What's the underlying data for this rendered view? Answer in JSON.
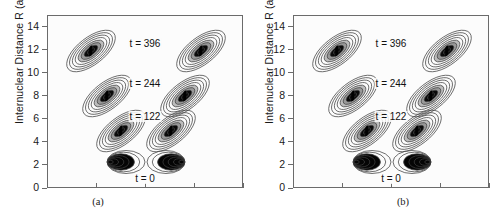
{
  "figure": {
    "panels": [
      {
        "id": "a",
        "caption": "(a)",
        "yaxis": {
          "title": "Internuclear Distance R (a.u.)",
          "ticks": [
            "14",
            "12",
            "10",
            "8",
            "6",
            "4",
            "2",
            "0"
          ],
          "min": 0,
          "max": 15
        },
        "xaxis": {
          "title": "",
          "ticks": [
            "",
            "",
            "",
            "",
            ""
          ]
        },
        "time_labels": [
          "t = 396",
          "t = 244",
          "t = 122",
          "t = 0"
        ]
      },
      {
        "id": "b",
        "caption": "(b)",
        "yaxis": {
          "title": "Internuclear Distance R (a.u.)",
          "ticks": [
            "14",
            "12",
            "10",
            "8",
            "6",
            "4",
            "2",
            "0"
          ],
          "min": 0,
          "max": 15
        },
        "xaxis": {
          "title": "",
          "ticks": [
            "",
            "",
            "",
            "",
            ""
          ]
        },
        "time_labels": [
          "t = 396",
          "t = 244",
          "t = 122",
          "t = 0"
        ]
      }
    ]
  },
  "chart_data": {
    "type": "contour",
    "title": "",
    "xlabel": "",
    "ylabel": "Internuclear Distance R (a.u.)",
    "ylim": [
      0,
      15
    ],
    "ytick_values": [
      0,
      2,
      4,
      6,
      8,
      10,
      12,
      14
    ],
    "xtick_count": 5,
    "grid": false,
    "legend": "none",
    "panels": [
      {
        "label": "(a)",
        "annotations": [
          {
            "text": "t = 396",
            "R": 12.6
          },
          {
            "text": "t = 244",
            "R": 9.1
          },
          {
            "text": "t = 122",
            "R": 6.2
          },
          {
            "text": "t = 0",
            "R": 0.9
          }
        ],
        "lobes": [
          {
            "time": 0,
            "R": 2.3,
            "side": "left",
            "x_rel": 0.4,
            "tilt_deg": 0,
            "rings": 7,
            "filled": true
          },
          {
            "time": 0,
            "R": 2.3,
            "side": "right",
            "x_rel": 0.6,
            "tilt_deg": 0,
            "rings": 7,
            "filled": true
          },
          {
            "time": 122,
            "R": 5.0,
            "side": "left",
            "x_rel": 0.37,
            "tilt_deg": -38,
            "rings": 8,
            "filled": false
          },
          {
            "time": 122,
            "R": 5.0,
            "side": "right",
            "x_rel": 0.63,
            "tilt_deg": -38,
            "rings": 8,
            "filled": false
          },
          {
            "time": 244,
            "R": 8.1,
            "side": "left",
            "x_rel": 0.3,
            "tilt_deg": -38,
            "rings": 8,
            "filled": false
          },
          {
            "time": 244,
            "R": 8.1,
            "side": "right",
            "x_rel": 0.7,
            "tilt_deg": -38,
            "rings": 8,
            "filled": false
          },
          {
            "time": 396,
            "R": 12.0,
            "side": "left",
            "x_rel": 0.22,
            "tilt_deg": -38,
            "rings": 8,
            "filled": false
          },
          {
            "time": 396,
            "R": 12.0,
            "side": "right",
            "x_rel": 0.78,
            "tilt_deg": -38,
            "rings": 8,
            "filled": false
          }
        ]
      },
      {
        "label": "(b)",
        "annotations": [
          {
            "text": "t = 396",
            "R": 12.6
          },
          {
            "text": "t = 244",
            "R": 9.1
          },
          {
            "text": "t = 122",
            "R": 6.2
          },
          {
            "text": "t = 0",
            "R": 0.9
          }
        ],
        "lobes": [
          {
            "time": 0,
            "R": 2.3,
            "side": "left",
            "x_rel": 0.4,
            "tilt_deg": 0,
            "rings": 7,
            "filled": true
          },
          {
            "time": 0,
            "R": 2.3,
            "side": "right",
            "x_rel": 0.6,
            "tilt_deg": 0,
            "rings": 7,
            "filled": true
          },
          {
            "time": 122,
            "R": 5.0,
            "side": "left",
            "x_rel": 0.37,
            "tilt_deg": -38,
            "rings": 8,
            "filled": false
          },
          {
            "time": 122,
            "R": 5.0,
            "side": "right",
            "x_rel": 0.63,
            "tilt_deg": -38,
            "rings": 8,
            "filled": false
          },
          {
            "time": 244,
            "R": 8.1,
            "side": "left",
            "x_rel": 0.3,
            "tilt_deg": -38,
            "rings": 8,
            "filled": false
          },
          {
            "time": 244,
            "R": 8.1,
            "side": "right",
            "x_rel": 0.7,
            "tilt_deg": -38,
            "rings": 8,
            "filled": false
          },
          {
            "time": 396,
            "R": 12.0,
            "side": "left",
            "x_rel": 0.22,
            "tilt_deg": -38,
            "rings": 8,
            "filled": false
          },
          {
            "time": 396,
            "R": 12.0,
            "side": "right",
            "x_rel": 0.78,
            "tilt_deg": -38,
            "rings": 8,
            "filled": false
          }
        ]
      }
    ],
    "colors": {
      "line": "#4a4a4a",
      "fill_core": "#000000",
      "background": "#fcfcfc",
      "axis": "#6b6b6b"
    }
  }
}
